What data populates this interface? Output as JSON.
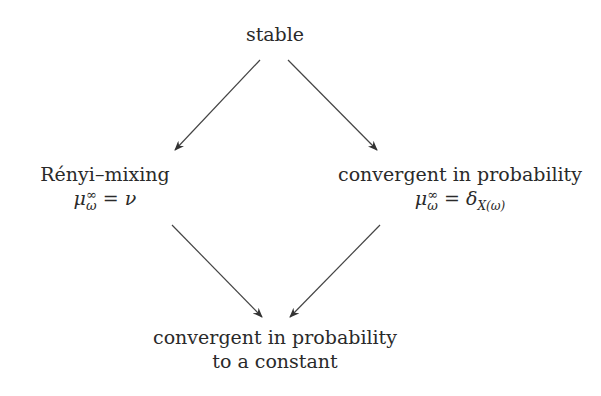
{
  "diagram": {
    "nodes": {
      "top": {
        "label": "stable"
      },
      "left": {
        "label": "Rényi–mixing",
        "formula_lhs": "μ",
        "sup": "∞",
        "sub": "ω",
        "formula_rhs": "= ν"
      },
      "right": {
        "label": "convergent in probability",
        "formula_lhs": "μ",
        "sup": "∞",
        "sub": "ω",
        "formula_rhs": "= δ",
        "rhs_sub": "X(ω)"
      },
      "bottom": {
        "line1": "convergent in probability",
        "line2": "to a constant"
      }
    },
    "edges": [
      {
        "from": "top",
        "to": "left"
      },
      {
        "from": "top",
        "to": "right"
      },
      {
        "from": "left",
        "to": "bottom"
      },
      {
        "from": "right",
        "to": "bottom"
      }
    ],
    "colors": {
      "line": "#333333",
      "text": "#2a2a2a"
    }
  }
}
